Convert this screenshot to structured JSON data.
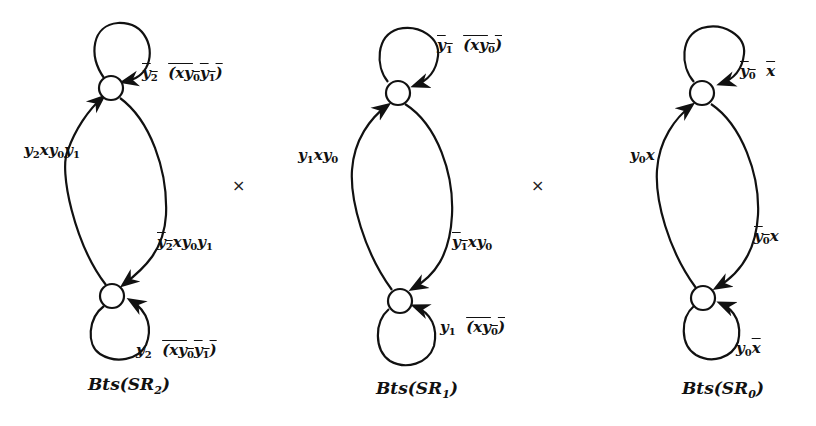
{
  "figure": {
    "operator_symbol": "×",
    "machines": [
      {
        "caption": "Bts(SR2)",
        "caption_parts": {
          "base": "Bts(SR",
          "sub": "2",
          "close": ")"
        },
        "states": [
          {
            "id": "top"
          },
          {
            "id": "bottom"
          }
        ],
        "transitions": [
          {
            "from": "top",
            "to": "top",
            "label": "¬y2 ¬(x y0 y1)",
            "label_plain": "y2 (xy0y1)",
            "negated": [
              "y2",
              "xy0y1"
            ]
          },
          {
            "from": "bottom",
            "to": "top",
            "label": "y2 x y0 y1"
          },
          {
            "from": "top",
            "to": "bottom",
            "label": "¬y2 x y0 y1"
          },
          {
            "from": "bottom",
            "to": "bottom",
            "label": "y2 ¬(x y0 y1)"
          }
        ]
      },
      {
        "caption": "Bts(SR1)",
        "caption_parts": {
          "base": "Bts(SR",
          "sub": "1",
          "close": ")"
        },
        "states": [
          {
            "id": "top"
          },
          {
            "id": "bottom"
          }
        ],
        "transitions": [
          {
            "from": "top",
            "to": "top",
            "label": "¬y1 ¬(x y0)"
          },
          {
            "from": "bottom",
            "to": "top",
            "label": "y1 x y0"
          },
          {
            "from": "top",
            "to": "bottom",
            "label": "¬y1 x y0"
          },
          {
            "from": "bottom",
            "to": "bottom",
            "label": "y1 ¬(x y0)"
          }
        ]
      },
      {
        "caption": "Bts(SR0)",
        "caption_parts": {
          "base": "Bts(SR",
          "sub": "0",
          "close": ")"
        },
        "states": [
          {
            "id": "top"
          },
          {
            "id": "bottom"
          }
        ],
        "transitions": [
          {
            "from": "top",
            "to": "top",
            "label": "¬y0 ¬x"
          },
          {
            "from": "bottom",
            "to": "top",
            "label": "y0 x"
          },
          {
            "from": "top",
            "to": "bottom",
            "label": "¬y0 x"
          },
          {
            "from": "bottom",
            "to": "bottom",
            "label": "y0 ¬x"
          }
        ]
      }
    ]
  }
}
